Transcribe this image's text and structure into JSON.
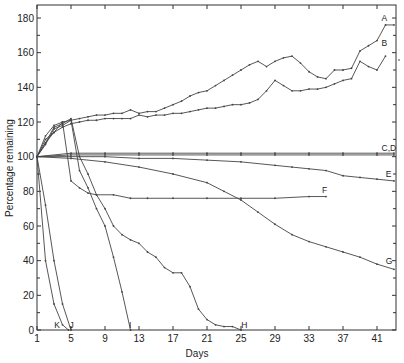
{
  "chart_data": {
    "type": "line",
    "title": "",
    "xlabel": "Days",
    "ylabel": "Percentage remaining",
    "xlim": [
      1,
      43.4
    ],
    "ylim": [
      0,
      186
    ],
    "x_ticks": [
      1,
      5,
      9,
      13,
      17,
      21,
      25,
      29,
      33,
      37,
      41
    ],
    "y_ticks": [
      0,
      20,
      40,
      60,
      80,
      100,
      120,
      140,
      160,
      180
    ],
    "grid": false,
    "legend": "inline labels at line ends",
    "series": [
      {
        "name": "A",
        "x": [
          1,
          2,
          3,
          4,
          5,
          6,
          7,
          8,
          9,
          10,
          11,
          12,
          13,
          14,
          15,
          16,
          17,
          18,
          19,
          20,
          21,
          22,
          23,
          24,
          25,
          26,
          27,
          28,
          29,
          30,
          31,
          32,
          33,
          34,
          35,
          36,
          37,
          38,
          39,
          40,
          41,
          42,
          43
        ],
        "values": [
          100,
          112,
          118,
          120,
          121,
          122,
          123,
          124,
          124,
          125,
          125,
          127,
          125,
          126,
          126,
          128,
          130,
          132,
          135,
          137,
          138,
          141,
          144,
          147,
          150,
          153,
          155,
          152,
          155,
          157,
          158,
          154,
          149,
          146,
          145,
          150,
          150,
          151,
          161,
          164,
          167,
          176,
          176
        ]
      },
      {
        "name": "B",
        "x": [
          1,
          2,
          3,
          4,
          5,
          6,
          7,
          8,
          9,
          10,
          11,
          12,
          13,
          14,
          15,
          16,
          17,
          18,
          19,
          20,
          21,
          22,
          23,
          24,
          25,
          26,
          27,
          28,
          29,
          30,
          31,
          32,
          33,
          34,
          35,
          36,
          37,
          38,
          39,
          40,
          41,
          42
        ],
        "values": [
          100,
          110,
          114,
          117,
          119,
          120,
          121,
          121,
          122,
          122,
          122,
          122,
          124,
          123,
          124,
          124,
          125,
          125,
          126,
          127,
          128,
          128,
          129,
          130,
          130,
          131,
          133,
          138,
          144,
          141,
          138,
          138,
          139,
          139,
          140,
          142,
          144,
          145,
          155,
          152,
          150,
          158
        ]
      },
      {
        "name": "C",
        "x": [
          1,
          5,
          9,
          13,
          17,
          21,
          25,
          29,
          33,
          37,
          41,
          43
        ],
        "values": [
          100,
          102,
          102,
          102,
          102,
          102,
          102,
          102,
          102,
          102,
          102,
          102
        ]
      },
      {
        "name": "D",
        "x": [
          1,
          5,
          9,
          13,
          17,
          21,
          25,
          29,
          33,
          37,
          41,
          43
        ],
        "values": [
          100,
          101,
          101,
          101,
          101,
          101,
          101,
          101,
          101,
          101,
          101,
          101
        ]
      },
      {
        "name": "E",
        "x": [
          1,
          5,
          9,
          13,
          17,
          21,
          25,
          29,
          31,
          33,
          35,
          37,
          39,
          41,
          43
        ],
        "values": [
          100,
          100,
          100,
          99,
          99,
          98,
          97,
          95,
          94,
          93,
          92,
          89,
          88,
          87,
          86
        ]
      },
      {
        "name": "F",
        "x": [
          1,
          2,
          3,
          4,
          5,
          6,
          7,
          8,
          10,
          12,
          14,
          17,
          21,
          25,
          29,
          33,
          35
        ],
        "values": [
          100,
          108,
          114,
          120,
          86,
          82,
          79,
          78,
          78,
          76,
          76,
          76,
          76,
          76,
          76,
          77,
          77
        ]
      },
      {
        "name": "G",
        "x": [
          1,
          5,
          9,
          13,
          17,
          21,
          23,
          25,
          27,
          29,
          31,
          33,
          35,
          37,
          39,
          41,
          43
        ],
        "values": [
          100,
          99,
          97,
          94,
          90,
          85,
          80,
          75,
          68,
          61,
          55,
          51,
          48,
          45,
          42,
          38,
          35
        ]
      },
      {
        "name": "H",
        "x": [
          1,
          2,
          3,
          4,
          5,
          6,
          7,
          8,
          9,
          10,
          11,
          12,
          13,
          14,
          15,
          16,
          17,
          18,
          19,
          20,
          21,
          22,
          23,
          24,
          25
        ],
        "values": [
          100,
          108,
          117,
          119,
          122,
          100,
          90,
          78,
          70,
          60,
          55,
          52,
          50,
          45,
          42,
          36,
          33,
          33,
          25,
          12,
          6,
          3,
          2,
          2,
          0
        ]
      },
      {
        "name": "I",
        "x": [
          1,
          2,
          3,
          4,
          5,
          6,
          7,
          8,
          9,
          10,
          11,
          12
        ],
        "values": [
          100,
          107,
          116,
          118,
          121,
          92,
          82,
          70,
          60,
          42,
          22,
          0
        ]
      },
      {
        "name": "J",
        "x": [
          1,
          2,
          3,
          4,
          5
        ],
        "values": [
          100,
          72,
          40,
          15,
          0
        ]
      },
      {
        "name": "K",
        "x": [
          1,
          2,
          3,
          4,
          4.7
        ],
        "values": [
          100,
          40,
          15,
          3,
          0
        ]
      }
    ],
    "annotations": [
      {
        "text": "A",
        "x": 42,
        "y": 178
      },
      {
        "text": "B",
        "x": 42,
        "y": 164
      },
      {
        "text": "C,D",
        "x": 42,
        "y": 103
      },
      {
        "text": "E",
        "x": 42.5,
        "y": 88
      },
      {
        "text": "F",
        "x": 35,
        "y": 79
      },
      {
        "text": "G",
        "x": 42.5,
        "y": 38
      },
      {
        "text": "H",
        "x": 25.5,
        "y": 1
      },
      {
        "text": "I",
        "x": 12.3,
        "y": 1
      },
      {
        "text": "J",
        "x": 5.3,
        "y": 1
      },
      {
        "text": "K",
        "x": 3.5,
        "y": 1
      }
    ]
  },
  "axes": {
    "x_title": "Days",
    "y_title": "Percentage remaining"
  }
}
